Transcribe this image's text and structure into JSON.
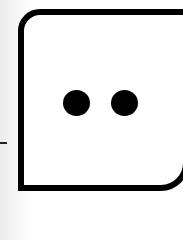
{
  "figure": {
    "face_value": 2,
    "pips": [
      {
        "index": 1,
        "color": "#000000"
      },
      {
        "index": 2,
        "color": "#000000"
      }
    ],
    "frame_color": "#000000",
    "face_color": "#ffffff"
  }
}
